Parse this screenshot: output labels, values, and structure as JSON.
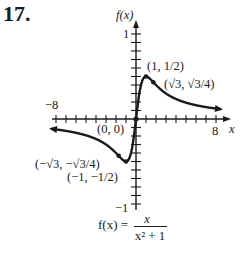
{
  "problem": {
    "number": "17."
  },
  "chart_data": {
    "type": "line",
    "title": "",
    "function": "f(x) = x / (x^2 + 1)",
    "formula": {
      "lhs": "f(x) =",
      "numerator": "x",
      "denominator": "x² + 1"
    },
    "xlabel": "x",
    "ylabel": "f(x)",
    "xlim": [
      -8,
      8
    ],
    "ylim": [
      -1,
      1
    ],
    "x_tick_step": 1,
    "y_tick_step": 0.1,
    "x_tick_labels": [
      "-8",
      "8"
    ],
    "y_tick_labels": [
      "1",
      "-1"
    ],
    "grid": false,
    "series": [
      {
        "name": "f(x)",
        "x": [
          -8.5,
          -6,
          -4,
          -3,
          -2,
          -1.732,
          -1.5,
          -1,
          -0.75,
          -0.5,
          -0.25,
          0,
          0.25,
          0.5,
          0.75,
          1,
          1.5,
          1.732,
          2,
          3,
          4,
          6,
          8.5
        ],
        "values": [
          -0.116,
          -0.162,
          -0.235,
          -0.3,
          -0.4,
          -0.433,
          -0.462,
          -0.5,
          -0.48,
          -0.4,
          -0.235,
          0,
          0.235,
          0.4,
          0.48,
          0.5,
          0.462,
          0.433,
          0.4,
          0.3,
          0.235,
          0.162,
          0.116
        ]
      }
    ],
    "annotations": [
      {
        "label": "(1, 1/2)",
        "x": 1,
        "y": 0.5
      },
      {
        "label": "(√3, √3/4)",
        "x": 1.732,
        "y": 0.433
      },
      {
        "label": "(0, 0)",
        "x": 0,
        "y": 0
      },
      {
        "label": "(−√3, −√3/4)",
        "x": -1.732,
        "y": -0.433
      },
      {
        "label": "(−1, −1/2)",
        "x": -1,
        "y": -0.5
      }
    ]
  },
  "labels": {
    "y_axis": "f(x)",
    "x_axis": "x",
    "y_top": "1",
    "y_bottom": "−1",
    "x_left": "−8",
    "x_right": "8",
    "pt_max": "(1, 1/2)",
    "pt_infl_pos": "(√3, √3/4)",
    "pt_origin": "(0, 0)",
    "pt_infl_neg": "(−√3, −√3/4)",
    "pt_min": "(−1, −1/2)",
    "formula_lhs": "f(x) =",
    "formula_num": "x",
    "formula_den": "x² + 1"
  }
}
